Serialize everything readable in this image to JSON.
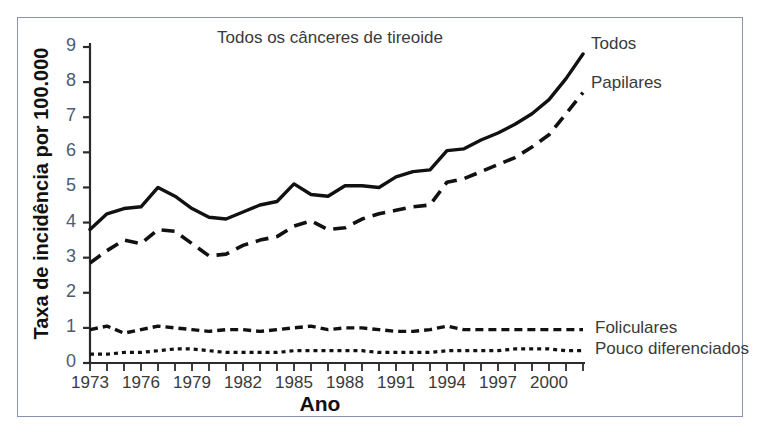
{
  "figure": {
    "title": "Todos os cânceres de tireoide",
    "xlabel": "Ano",
    "ylabel": "Taxa de incidência por 100.000",
    "frame_color": "#8a92ad",
    "axis_color": "#2b2b2b",
    "tick_label_color": "#4a5c75",
    "line_color": "#111111"
  },
  "axes": {
    "y_ticks": [
      "0",
      "1",
      "2",
      "3",
      "4",
      "5",
      "6",
      "7",
      "8",
      "9"
    ],
    "x_ticks": [
      "1973",
      "1976",
      "1979",
      "1982",
      "1985",
      "1988",
      "1991",
      "1994",
      "1997",
      "2000"
    ],
    "ylim": [
      0,
      9
    ],
    "xlim": [
      1973,
      2002
    ]
  },
  "series_labels": {
    "todos": "Todos",
    "papilares": "Papilares",
    "foliculares": "Foliculares",
    "pouco": "Pouco diferenciados"
  },
  "chart_data": {
    "type": "line",
    "title": "Todos os cânceres de tireoide",
    "xlabel": "Ano",
    "ylabel": "Taxa de incidência por 100.000",
    "xlim": [
      1973,
      2002
    ],
    "ylim": [
      0,
      9
    ],
    "grid": false,
    "legend_position": "right-inline",
    "x": [
      1973,
      1974,
      1975,
      1976,
      1977,
      1978,
      1979,
      1980,
      1981,
      1982,
      1983,
      1984,
      1985,
      1986,
      1987,
      1988,
      1989,
      1990,
      1991,
      1992,
      1993,
      1994,
      1995,
      1996,
      1997,
      1998,
      1999,
      2000,
      2001,
      2002
    ],
    "series": [
      {
        "name": "Todos",
        "style": "solid",
        "values": [
          3.8,
          4.25,
          4.4,
          4.45,
          5.0,
          4.75,
          4.4,
          4.15,
          4.1,
          4.3,
          4.5,
          4.6,
          5.1,
          4.8,
          4.75,
          5.05,
          5.05,
          5.0,
          5.3,
          5.45,
          5.5,
          6.05,
          6.1,
          6.35,
          6.55,
          6.8,
          7.1,
          7.5,
          8.1,
          8.8
        ]
      },
      {
        "name": "Papilares",
        "style": "dashed-long",
        "values": [
          2.85,
          3.2,
          3.5,
          3.4,
          3.8,
          3.75,
          3.4,
          3.05,
          3.1,
          3.35,
          3.5,
          3.6,
          3.9,
          4.05,
          3.8,
          3.85,
          4.1,
          4.25,
          4.35,
          4.45,
          4.5,
          5.15,
          5.25,
          5.45,
          5.65,
          5.85,
          6.15,
          6.5,
          7.1,
          7.7
        ]
      },
      {
        "name": "Foliculares",
        "style": "dashed-short",
        "values": [
          0.95,
          1.05,
          0.85,
          0.95,
          1.05,
          1.0,
          0.95,
          0.9,
          0.95,
          0.95,
          0.9,
          0.95,
          1.0,
          1.05,
          0.95,
          1.0,
          1.0,
          0.95,
          0.9,
          0.9,
          0.95,
          1.05,
          0.95,
          0.95,
          0.95,
          0.95,
          0.95,
          0.95,
          0.95,
          0.95
        ]
      },
      {
        "name": "Pouco diferenciados",
        "style": "dotted",
        "values": [
          0.25,
          0.25,
          0.3,
          0.3,
          0.35,
          0.4,
          0.4,
          0.35,
          0.3,
          0.3,
          0.3,
          0.3,
          0.35,
          0.35,
          0.35,
          0.35,
          0.35,
          0.3,
          0.3,
          0.3,
          0.3,
          0.35,
          0.35,
          0.35,
          0.35,
          0.4,
          0.4,
          0.4,
          0.35,
          0.35
        ]
      }
    ]
  }
}
